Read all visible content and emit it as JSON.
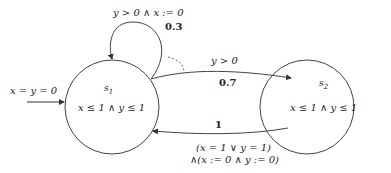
{
  "diagram": {
    "type": "probabilistic-timed-automaton",
    "states": [
      {
        "id": "s1",
        "name": "s",
        "subscript": "1",
        "invariant": "x ≤ 1 ∧ y ≤ 1",
        "initial": true
      },
      {
        "id": "s2",
        "name": "s",
        "subscript": "2",
        "invariant": "x ≤ 1 ∧ y ≤ 1",
        "initial": false
      }
    ],
    "initial": {
      "label": "x = y = 0"
    },
    "edges": [
      {
        "from": "s1",
        "to": "s1",
        "guard": "y > 0 ∧ x := 0",
        "probability": "0.3"
      },
      {
        "from": "s1",
        "to": "s2",
        "guard": "y > 0",
        "probability": "0.7"
      },
      {
        "from": "s2",
        "to": "s1",
        "probability": "1",
        "guard_line1": "(x = 1 ∨ y = 1)",
        "guard_line2": "∧(x := 0 ∧ y := 0)"
      }
    ]
  }
}
